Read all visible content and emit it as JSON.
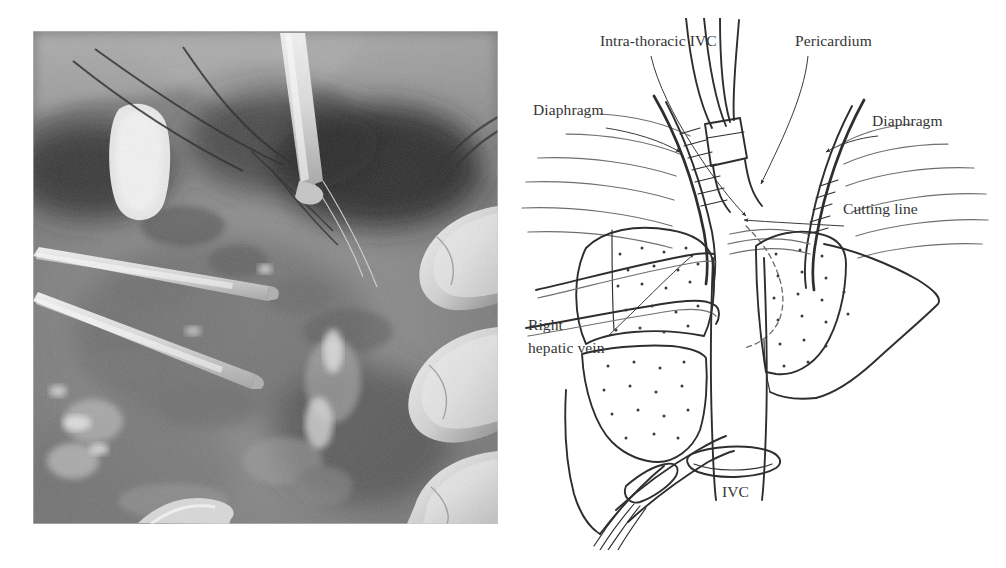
{
  "figure": {
    "type": "medical-surgical-figure",
    "panels": [
      "intraoperative-photograph",
      "schematic-line-diagram"
    ],
    "background_color": "#ffffff",
    "ink_color": "#2e2e2e"
  },
  "photo": {
    "caption": "",
    "description": "Grayscale intraoperative photograph of the supra-hepatic inferior vena cava exposure",
    "rendering": "monochrome-surgical-field",
    "tone_dark": "#2a2a2a",
    "tone_mid": "#8d8d8d",
    "tone_light": "#e6e6e6"
  },
  "diagram": {
    "title": "",
    "labels": [
      {
        "id": "intra-thoracic-ivc",
        "text": "Intra-thoracic IVC",
        "x": 600,
        "y": 46,
        "anchor": "start",
        "lines": 1
      },
      {
        "id": "pericardium",
        "text": "Pericardium",
        "x": 795,
        "y": 46,
        "anchor": "start",
        "lines": 1
      },
      {
        "id": "diaphragm-left",
        "text": "Diaphragm",
        "x": 533,
        "y": 115,
        "anchor": "start",
        "lines": 1
      },
      {
        "id": "diaphragm-right",
        "text": "Diaphragm",
        "x": 872,
        "y": 126,
        "anchor": "start",
        "lines": 1
      },
      {
        "id": "cutting-line",
        "text": "Cutting line",
        "x": 843,
        "y": 214,
        "anchor": "start",
        "lines": 1
      },
      {
        "id": "right-hepatic-vein-1",
        "text": "Right",
        "x": 528,
        "y": 330,
        "anchor": "start",
        "lines": 2
      },
      {
        "id": "right-hepatic-vein-2",
        "text": "hepatic vein",
        "x": 528,
        "y": 353,
        "anchor": "start",
        "lines": 2
      },
      {
        "id": "ivc",
        "text": "IVC",
        "x": 722,
        "y": 497,
        "anchor": "start",
        "lines": 1
      }
    ],
    "structures": [
      "intra-thoracic-inferior-vena-cava",
      "pericardium",
      "diaphragm-left-leaf",
      "diaphragm-right-leaf",
      "liver-right-lobe",
      "liver-left-lobe",
      "right-hepatic-vein",
      "infra-hepatic-inferior-vena-cava",
      "vessel-loop-ligature",
      "cannula",
      "cutting-line-dashed"
    ],
    "annotation_style": {
      "leader": "thin-line-with-solid-arrowhead",
      "cutting_line_style": "dashed",
      "liver_fill": "stippled-dots"
    }
  }
}
